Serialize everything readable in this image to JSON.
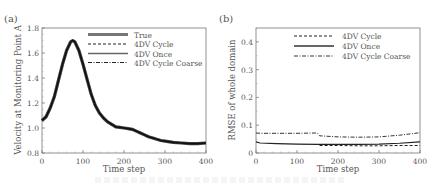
{
  "panels": [
    {
      "label": "(a)",
      "ylabel": "Velocity at Monitoring Point A",
      "xlabel": "Time step",
      "xticks": [
        "0",
        "100",
        "200",
        "300",
        "400"
      ],
      "yticks": [
        "0.8",
        "1.0",
        "1.2",
        "1.4",
        "1.6",
        "1.8"
      ],
      "legend": [
        "True",
        "4DV Cycle",
        "4DV Once",
        "4DV Cycle Coarse"
      ]
    },
    {
      "label": "(b)",
      "ylabel": "RMSE of whole domain",
      "xlabel": "Time step",
      "xticks": [
        "0",
        "100",
        "200",
        "300",
        "400"
      ],
      "yticks": [
        "0",
        "0.1",
        "0.2",
        "0.3",
        "0.4"
      ],
      "legend": [
        "4DV Cycle",
        "4DV Once",
        "4DV Cycle Coarse"
      ]
    }
  ],
  "chart_data": [
    {
      "type": "line",
      "title": "(a)",
      "xlabel": "Time step",
      "ylabel": "Velocity at Monitoring Point A",
      "xlim": [
        0,
        400
      ],
      "ylim": [
        0.8,
        1.8
      ],
      "grid": false,
      "legend_position": "upper right",
      "x": [
        0,
        10,
        20,
        30,
        40,
        50,
        60,
        70,
        75,
        80,
        90,
        100,
        110,
        120,
        130,
        140,
        150,
        160,
        170,
        180,
        190,
        200,
        210,
        220,
        230,
        240,
        250,
        260,
        270,
        280,
        290,
        300,
        320,
        340,
        360,
        380,
        400
      ],
      "series": [
        {
          "name": "True",
          "values": [
            1.06,
            1.09,
            1.16,
            1.25,
            1.38,
            1.51,
            1.62,
            1.69,
            1.7,
            1.69,
            1.62,
            1.51,
            1.39,
            1.27,
            1.18,
            1.12,
            1.08,
            1.05,
            1.03,
            1.01,
            1.005,
            1.0,
            0.995,
            0.99,
            0.975,
            0.96,
            0.945,
            0.93,
            0.92,
            0.91,
            0.9,
            0.895,
            0.885,
            0.88,
            0.875,
            0.875,
            0.88
          ]
        },
        {
          "name": "4DV Cycle",
          "values": [
            1.06,
            1.09,
            1.16,
            1.25,
            1.38,
            1.51,
            1.62,
            1.69,
            1.7,
            1.69,
            1.62,
            1.51,
            1.39,
            1.27,
            1.18,
            1.12,
            1.08,
            1.05,
            1.03,
            1.01,
            1.005,
            1.0,
            0.995,
            0.99,
            0.975,
            0.96,
            0.945,
            0.93,
            0.92,
            0.91,
            0.9,
            0.895,
            0.885,
            0.88,
            0.875,
            0.875,
            0.88
          ]
        },
        {
          "name": "4DV Once",
          "values": [
            1.06,
            1.09,
            1.16,
            1.25,
            1.38,
            1.51,
            1.62,
            1.69,
            1.7,
            1.69,
            1.62,
            1.51,
            1.39,
            1.27,
            1.18,
            1.12,
            1.08,
            1.05,
            1.03,
            1.01,
            1.005,
            1.0,
            0.995,
            0.99,
            0.975,
            0.96,
            0.945,
            0.93,
            0.92,
            0.91,
            0.9,
            0.895,
            0.885,
            0.88,
            0.875,
            0.875,
            0.88
          ]
        },
        {
          "name": "4DV Cycle Coarse",
          "values": [
            1.06,
            1.09,
            1.16,
            1.25,
            1.38,
            1.51,
            1.62,
            1.69,
            1.7,
            1.69,
            1.62,
            1.51,
            1.39,
            1.27,
            1.18,
            1.12,
            1.08,
            1.05,
            1.03,
            1.01,
            1.005,
            1.0,
            0.995,
            0.99,
            0.975,
            0.96,
            0.945,
            0.93,
            0.92,
            0.91,
            0.9,
            0.895,
            0.885,
            0.88,
            0.875,
            0.875,
            0.88
          ]
        }
      ]
    },
    {
      "type": "line",
      "title": "(b)",
      "xlabel": "Time step",
      "ylabel": "RMSE of whole domain",
      "xlim": [
        0,
        400
      ],
      "ylim": [
        0,
        0.45
      ],
      "grid": false,
      "legend_position": "upper right",
      "x": [
        0,
        10,
        50,
        100,
        150,
        155,
        200,
        250,
        300,
        350,
        400
      ],
      "series": [
        {
          "name": "4DV Cycle",
          "x": [
            155,
            200,
            250,
            300,
            350,
            400
          ],
          "values": [
            0.027,
            0.027,
            0.026,
            0.026,
            0.027,
            0.027
          ]
        },
        {
          "name": "4DV Once",
          "values": [
            0.04,
            0.036,
            0.034,
            0.032,
            0.031,
            0.031,
            0.031,
            0.031,
            0.032,
            0.035,
            0.04
          ]
        },
        {
          "name": "4DV Cycle Coarse",
          "values": [
            0.072,
            0.071,
            0.071,
            0.071,
            0.072,
            0.062,
            0.058,
            0.057,
            0.058,
            0.064,
            0.073
          ]
        }
      ]
    }
  ]
}
